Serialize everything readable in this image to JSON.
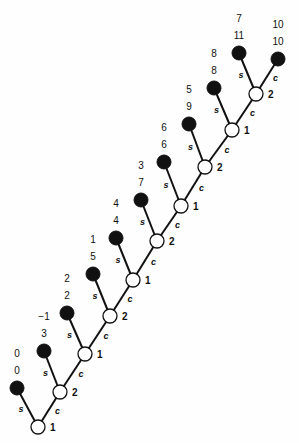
{
  "diagram": {
    "type": "binary-tree-chain",
    "edge_labels": {
      "left": "s",
      "right": "c"
    },
    "open_nodes": [
      {
        "id": "o1",
        "x": 38,
        "y": 427,
        "label": "1"
      },
      {
        "id": "o2",
        "x": 60,
        "y": 392,
        "label": "2"
      },
      {
        "id": "o3",
        "x": 85,
        "y": 354,
        "label": "1"
      },
      {
        "id": "o4",
        "x": 110,
        "y": 316,
        "label": "2"
      },
      {
        "id": "o5",
        "x": 133,
        "y": 280,
        "label": "1"
      },
      {
        "id": "o6",
        "x": 157,
        "y": 241,
        "label": "2"
      },
      {
        "id": "o7",
        "x": 181,
        "y": 206,
        "label": "1"
      },
      {
        "id": "o8",
        "x": 205,
        "y": 167,
        "label": "2"
      },
      {
        "id": "o9",
        "x": 232,
        "y": 130,
        "label": "1"
      },
      {
        "id": "o10",
        "x": 256,
        "y": 94,
        "label": "2"
      }
    ],
    "leaf_nodes": [
      {
        "id": "b0",
        "parent": "o1",
        "x": 17,
        "y": 388,
        "top": "0",
        "bottom": "0",
        "edge": "s"
      },
      {
        "id": "b1",
        "parent": "o2",
        "x": 44,
        "y": 351,
        "top": "−1",
        "bottom": "3",
        "edge": "s"
      },
      {
        "id": "b2",
        "parent": "o3",
        "x": 67,
        "y": 313,
        "top": "2",
        "bottom": "2",
        "edge": "s"
      },
      {
        "id": "b3",
        "parent": "o4",
        "x": 93,
        "y": 274,
        "top": "1",
        "bottom": "5",
        "edge": "s"
      },
      {
        "id": "b4",
        "parent": "o5",
        "x": 116,
        "y": 238,
        "top": "4",
        "bottom": "4",
        "edge": "s"
      },
      {
        "id": "b5",
        "parent": "o6",
        "x": 141,
        "y": 200,
        "top": "3",
        "bottom": "7",
        "edge": "s"
      },
      {
        "id": "b6",
        "parent": "o7",
        "x": 164,
        "y": 162,
        "top": "6",
        "bottom": "6",
        "edge": "s"
      },
      {
        "id": "b7",
        "parent": "o8",
        "x": 189,
        "y": 124,
        "top": "5",
        "bottom": "9",
        "edge": "s"
      },
      {
        "id": "b8",
        "parent": "o9",
        "x": 214,
        "y": 88,
        "top": "8",
        "bottom": "8",
        "edge": "s"
      },
      {
        "id": "b9",
        "parent": "o10",
        "x": 239,
        "y": 53,
        "top": "7",
        "bottom": "11",
        "edge": "s"
      },
      {
        "id": "b10",
        "parent": "o10",
        "x": 278,
        "y": 59,
        "top": "10",
        "bottom": "10",
        "edge": "c"
      }
    ],
    "colors": {
      "line": "#111111",
      "leaf_fill": "#111111",
      "open_fill": "#ffffff"
    }
  }
}
